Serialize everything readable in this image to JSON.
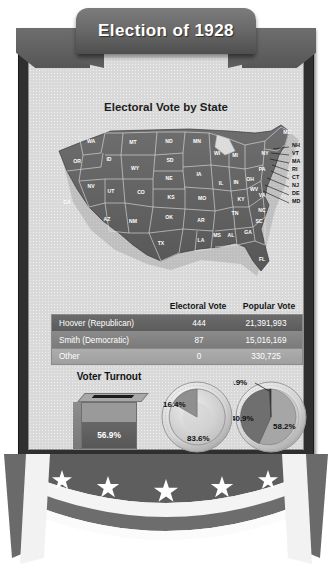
{
  "poster": {
    "title": "Election of 1928",
    "map_title": "Electoral Vote by State"
  },
  "map": {
    "states": [
      {
        "abbr": "WA",
        "x": 42,
        "y": 22
      },
      {
        "abbr": "OR",
        "x": 28,
        "y": 42
      },
      {
        "abbr": "CA",
        "x": 18,
        "y": 83
      },
      {
        "abbr": "NV",
        "x": 42,
        "y": 67
      },
      {
        "abbr": "ID",
        "x": 60,
        "y": 40
      },
      {
        "abbr": "MT",
        "x": 84,
        "y": 23
      },
      {
        "abbr": "WY",
        "x": 86,
        "y": 49
      },
      {
        "abbr": "UT",
        "x": 62,
        "y": 72
      },
      {
        "abbr": "AZ",
        "x": 58,
        "y": 100
      },
      {
        "abbr": "CO",
        "x": 92,
        "y": 73
      },
      {
        "abbr": "NM",
        "x": 84,
        "y": 102
      },
      {
        "abbr": "ND",
        "x": 120,
        "y": 22
      },
      {
        "abbr": "SD",
        "x": 121,
        "y": 41
      },
      {
        "abbr": "NE",
        "x": 120,
        "y": 59
      },
      {
        "abbr": "KS",
        "x": 122,
        "y": 78
      },
      {
        "abbr": "OK",
        "x": 120,
        "y": 98
      },
      {
        "abbr": "TX",
        "x": 112,
        "y": 124
      },
      {
        "abbr": "MN",
        "x": 148,
        "y": 22
      },
      {
        "abbr": "IA",
        "x": 150,
        "y": 55
      },
      {
        "abbr": "MO",
        "x": 153,
        "y": 79
      },
      {
        "abbr": "AR",
        "x": 152,
        "y": 101
      },
      {
        "abbr": "LA",
        "x": 152,
        "y": 121
      },
      {
        "abbr": "WI",
        "x": 168,
        "y": 34
      },
      {
        "abbr": "IL",
        "x": 172,
        "y": 64
      },
      {
        "abbr": "MS",
        "x": 168,
        "y": 116
      },
      {
        "abbr": "MI",
        "x": 186,
        "y": 36
      },
      {
        "abbr": "IN",
        "x": 187,
        "y": 63
      },
      {
        "abbr": "AL",
        "x": 182,
        "y": 116
      },
      {
        "abbr": "OH",
        "x": 201,
        "y": 60
      },
      {
        "abbr": "KY",
        "x": 192,
        "y": 80
      },
      {
        "abbr": "TN",
        "x": 186,
        "y": 94
      },
      {
        "abbr": "GA",
        "x": 199,
        "y": 113
      },
      {
        "abbr": "FL",
        "x": 213,
        "y": 140
      },
      {
        "abbr": "SC",
        "x": 210,
        "y": 102
      },
      {
        "abbr": "NC",
        "x": 213,
        "y": 91
      },
      {
        "abbr": "VA",
        "x": 213,
        "y": 76
      },
      {
        "abbr": "WV",
        "x": 205,
        "y": 70
      },
      {
        "abbr": "PA",
        "x": 213,
        "y": 50
      },
      {
        "abbr": "NY",
        "x": 216,
        "y": 34
      },
      {
        "abbr": "ME",
        "x": 238,
        "y": 13
      }
    ],
    "callouts": [
      {
        "abbr": "NH",
        "x": 243,
        "y": 26
      },
      {
        "abbr": "VT",
        "x": 243,
        "y": 34
      },
      {
        "abbr": "MA",
        "x": 243,
        "y": 42
      },
      {
        "abbr": "RI",
        "x": 243,
        "y": 50
      },
      {
        "abbr": "CT",
        "x": 243,
        "y": 58
      },
      {
        "abbr": "NJ",
        "x": 243,
        "y": 66
      },
      {
        "abbr": "DE",
        "x": 243,
        "y": 74
      },
      {
        "abbr": "MD",
        "x": 243,
        "y": 82
      }
    ]
  },
  "table": {
    "headers": {
      "name": "",
      "electoral": "Electoral Vote",
      "popular": "Popular Vote"
    },
    "rows": [
      {
        "name": "Hoover  (Republican)",
        "electoral": "444",
        "popular": "21,391,993"
      },
      {
        "name": "Smith  (Democratic)",
        "electoral": "87",
        "popular": "15,016,169"
      },
      {
        "name": "Other",
        "electoral": "0",
        "popular": "330,725"
      }
    ]
  },
  "turnout": {
    "label": "Voter Turnout",
    "value": "56.9%"
  },
  "charts": {
    "electoral_pie": {
      "title": "Electoral Vote",
      "slices": [
        {
          "label": "83.6%",
          "value": 83.6
        },
        {
          "label": "16.4%",
          "value": 16.4
        }
      ]
    },
    "popular_pie": {
      "title": "Popular Vote",
      "slices": [
        {
          "label": "58.2%",
          "value": 58.2
        },
        {
          "label": "40.9%",
          "value": 40.9
        },
        {
          "label": "0.9%",
          "value": 0.9
        }
      ]
    }
  },
  "chart_data": [
    {
      "type": "pie",
      "title": "Electoral Vote",
      "categories": [
        "Hoover (Republican)",
        "Smith (Democratic)"
      ],
      "values": [
        83.6,
        16.4
      ],
      "labels": [
        "83.6%",
        "16.4%"
      ],
      "legend": "none"
    },
    {
      "type": "pie",
      "title": "Popular Vote",
      "categories": [
        "Hoover (Republican)",
        "Smith (Democratic)",
        "Other"
      ],
      "values": [
        58.2,
        40.9,
        0.9
      ],
      "labels": [
        "58.2%",
        "40.9%",
        "0.9%"
      ],
      "legend": "none"
    },
    {
      "type": "bar",
      "title": "Voter Turnout",
      "categories": [
        "Voter Turnout"
      ],
      "values": [
        56.9
      ],
      "labels": [
        "56.9%"
      ],
      "ylim": [
        0,
        100
      ],
      "ylabel": "Percent of eligible voters"
    },
    {
      "type": "table",
      "title": "Election of 1928 results",
      "columns": [
        "",
        "Electoral Vote",
        "Popular Vote"
      ],
      "rows": [
        [
          "Hoover  (Republican)",
          444,
          21391993
        ],
        [
          "Smith  (Democratic)",
          87,
          15016169
        ],
        [
          "Other",
          0,
          330725
        ]
      ]
    }
  ],
  "bunting": {
    "star_count": 5
  },
  "colors": {
    "frame": "#2f2f2f",
    "panel": "#d9d9d9",
    "hoover": "#5c5c5c",
    "smith": "#8a8a8a",
    "other": "#adadad",
    "banner": "#6a6a6a"
  }
}
